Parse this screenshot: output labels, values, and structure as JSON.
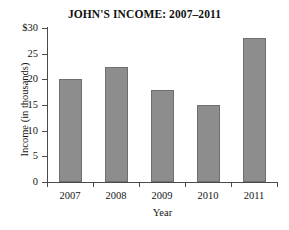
{
  "chart_data": {
    "type": "bar",
    "title": "JOHN'S INCOME: 2007–2011",
    "xlabel": "Year",
    "ylabel": "Income  (in thousands)",
    "categories": [
      "2007",
      "2008",
      "2009",
      "2010",
      "2011"
    ],
    "values": [
      20,
      22.5,
      18,
      15,
      28
    ],
    "ylim": [
      0,
      30
    ],
    "ytick_values": [
      0,
      5,
      10,
      15,
      20,
      25,
      30
    ],
    "ytick_labels": [
      "0",
      "5",
      "10",
      "15",
      "20",
      "25",
      "$30"
    ],
    "grid": false,
    "legend": null,
    "bar_color": "#8d8d8d",
    "bar_border_color": "#6f6f6f",
    "axis_color": "#4a4a4a",
    "background_color": "#ffffff"
  }
}
